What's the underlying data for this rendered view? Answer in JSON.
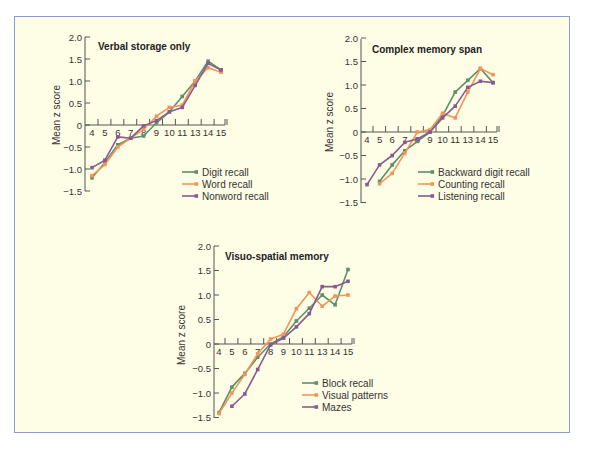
{
  "colors": {
    "background": "#fefde6",
    "border": "#8e99cc",
    "axis": "#555555",
    "series": [
      "#5e8f6a",
      "#f2955a",
      "#8a5a8e"
    ]
  },
  "chart_data": [
    {
      "type": "line",
      "title": "Verbal storage only",
      "xlabel": "",
      "ylabel": "Mean z score",
      "categories": [
        "4",
        "5",
        "6",
        "7",
        "8",
        "9",
        "10",
        "11",
        "13",
        "14",
        "15"
      ],
      "ylim": [
        -1.5,
        2.0
      ],
      "yticks": [
        "2.0",
        "1.5",
        "1.0",
        "0.5",
        "0",
        "-0.5",
        "-1.0",
        "-1.5"
      ],
      "legend_position": "lower right",
      "series": [
        {
          "name": "Digit recall",
          "values": [
            -1.2,
            -0.85,
            -0.45,
            -0.3,
            -0.25,
            0.05,
            0.3,
            0.65,
            1.0,
            1.45,
            1.25
          ]
        },
        {
          "name": "Word recall",
          "values": [
            -1.15,
            -0.9,
            -0.5,
            -0.3,
            -0.1,
            0.2,
            0.4,
            0.45,
            1.0,
            1.3,
            1.2
          ]
        },
        {
          "name": "Nonword recall",
          "values": [
            -0.97,
            -0.8,
            -0.27,
            -0.3,
            -0.02,
            0.1,
            0.3,
            0.4,
            0.9,
            1.4,
            1.25
          ]
        }
      ],
      "layout": {
        "x0": 85,
        "y0": 125,
        "ypx": 44,
        "xstart": 92,
        "xstep": 12.9,
        "ytop": 37,
        "ybot": 191,
        "title_x": 98,
        "title_y": 50,
        "legend_x": 182,
        "legend_y": 172,
        "ylabel_x": 60,
        "ylabel_y": 115
      }
    },
    {
      "type": "line",
      "title": "Complex memory span",
      "xlabel": "",
      "ylabel": "Mean z score",
      "categories": [
        "4",
        "5",
        "6",
        "7",
        "8",
        "9",
        "10",
        "11",
        "13",
        "14",
        "15"
      ],
      "ylim": [
        -1.5,
        2.0
      ],
      "yticks": [
        "2.0",
        "1.5",
        "1.0",
        "0.5",
        "0",
        "-0.5",
        "-1.0",
        "-1.5"
      ],
      "legend_position": "lower right",
      "series": [
        {
          "name": "Backward digit recall",
          "values": [
            null,
            -1.05,
            -0.7,
            -0.4,
            -0.2,
            0.0,
            0.35,
            0.85,
            1.1,
            1.35,
            1.05
          ]
        },
        {
          "name": "Counting recall",
          "values": [
            null,
            -1.1,
            -0.88,
            -0.45,
            0.0,
            0.05,
            0.4,
            0.3,
            0.85,
            1.35,
            1.22
          ]
        },
        {
          "name": "Listening recall",
          "values": [
            -1.12,
            -0.7,
            -0.5,
            -0.22,
            -0.15,
            0.0,
            0.3,
            0.55,
            0.95,
            1.08,
            1.05
          ]
        }
      ],
      "layout": {
        "x0": 361,
        "y0": 132,
        "ypx": 47,
        "xstart": 367,
        "xstep": 12.6,
        "ytop": 39,
        "ybot": 203,
        "title_x": 372,
        "title_y": 53,
        "legend_x": 418,
        "legend_y": 172,
        "ylabel_x": 333,
        "ylabel_y": 122
      }
    },
    {
      "type": "line",
      "title": "Visuo-spatial memory",
      "xlabel": "",
      "ylabel": "Mean z score",
      "categories": [
        "4",
        "5",
        "6",
        "7",
        "8",
        "9",
        "10",
        "11",
        "13",
        "14",
        "15"
      ],
      "ylim": [
        -1.5,
        2.0
      ],
      "yticks": [
        "2.0",
        "1.5",
        "1.0",
        "0.5",
        "0",
        "-0.5",
        "-1.0",
        "-1.5"
      ],
      "legend_position": "lower right",
      "series": [
        {
          "name": "Block recall",
          "values": [
            -1.4,
            -0.88,
            -0.6,
            -0.27,
            0.0,
            0.15,
            0.47,
            0.73,
            1.0,
            0.8,
            1.52
          ]
        },
        {
          "name": "Visual patterns",
          "values": [
            -1.42,
            -1.0,
            -0.62,
            -0.2,
            0.1,
            0.2,
            0.72,
            1.05,
            0.77,
            0.98,
            1.0
          ]
        },
        {
          "name": "Mazes",
          "values": [
            null,
            -1.27,
            -1.02,
            -0.52,
            -0.02,
            0.12,
            0.35,
            0.62,
            1.17,
            1.17,
            1.28
          ]
        }
      ],
      "layout": {
        "x0": 214,
        "y0": 344,
        "ypx": 49,
        "xstart": 219,
        "xstep": 12.9,
        "ytop": 246,
        "ybot": 418,
        "title_x": 225,
        "title_y": 260,
        "legend_x": 302,
        "legend_y": 383,
        "ylabel_x": 185,
        "ylabel_y": 335
      }
    }
  ]
}
